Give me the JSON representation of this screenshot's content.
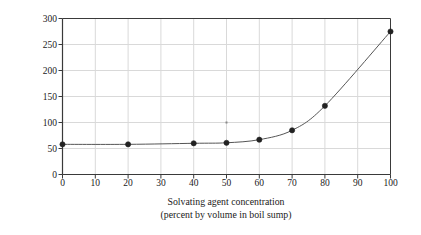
{
  "chart_data": {
    "type": "line",
    "title": "",
    "subtitle": "",
    "xlabel": "Solvating agent concentration",
    "xlabel_line2": "(percent by volume in boil sump)",
    "ylabel": "Mixture boiling point (°C)",
    "xlim": [
      0,
      100
    ],
    "ylim": [
      0,
      300
    ],
    "x_ticks": [
      0,
      10,
      20,
      30,
      40,
      50,
      60,
      70,
      80,
      90,
      100
    ],
    "y_ticks": [
      0,
      50,
      100,
      150,
      200,
      250,
      300
    ],
    "x_tick_labels": [
      "0",
      "10",
      "20",
      "30",
      "40",
      "50",
      "60",
      "70",
      "80",
      "90",
      "100"
    ],
    "y_tick_labels": [
      "0",
      "50",
      "100",
      "150",
      "200",
      "250",
      "300"
    ],
    "grid": true,
    "grid_color": "#d9d9d9",
    "axis_color": "#3a3a3a",
    "legend": false,
    "legend_position": "none",
    "marker": "circle",
    "marker_color": "#222222",
    "line_color": "#555555",
    "x": [
      0,
      20,
      40,
      50,
      60,
      70,
      80,
      100
    ],
    "values": [
      58,
      58,
      60,
      61,
      67,
      85,
      132,
      275
    ],
    "series": [
      {
        "name": "Mixture boiling point",
        "x": [
          0,
          20,
          40,
          50,
          60,
          70,
          80,
          100
        ],
        "values": [
          58,
          58,
          60,
          61,
          67,
          85,
          132,
          275
        ]
      }
    ],
    "annotations": [
      {
        "name": "stray-dot-artifact",
        "x": 50,
        "y": 100
      }
    ]
  },
  "figure": {
    "background": "#ffffff"
  }
}
